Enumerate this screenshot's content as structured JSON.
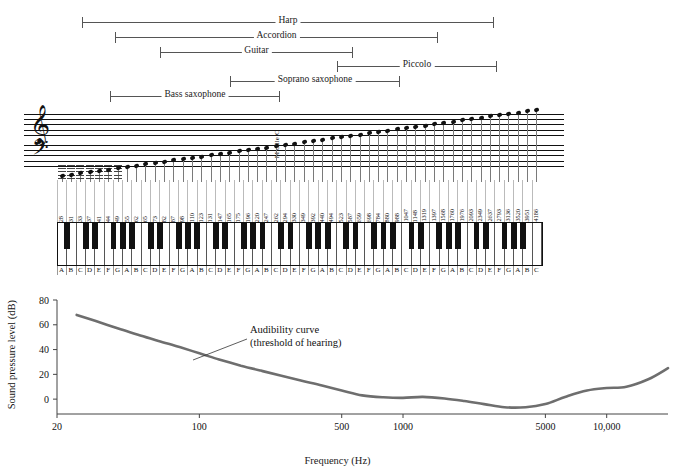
{
  "figure": {
    "instrument_ranges": [
      {
        "name": "Harp",
        "x1": 82,
        "x2": 494,
        "y": 16
      },
      {
        "name": "Accordion",
        "x1": 115,
        "x2": 438,
        "y": 31
      },
      {
        "name": "Guitar",
        "x1": 160,
        "x2": 353,
        "y": 46
      },
      {
        "name": "Piccolo",
        "x1": 337,
        "x2": 497,
        "y": 60
      },
      {
        "name": "Soprano saxophone",
        "x1": 230,
        "x2": 400,
        "y": 75
      },
      {
        "name": "Bass saxophone",
        "x1": 110,
        "x2": 280,
        "y": 90
      }
    ],
    "staff": {
      "treble_clef": "𝄞",
      "bass_clef": "𝄢",
      "middle_c_label": "Middle C"
    },
    "keyboard": {
      "note_letters": [
        "A",
        "B",
        "C",
        "D",
        "E",
        "F",
        "G",
        "A",
        "B",
        "C",
        "D",
        "E",
        "F",
        "G",
        "A",
        "B",
        "C",
        "D",
        "E",
        "F",
        "G",
        "A",
        "B",
        "C",
        "D",
        "E",
        "F",
        "G",
        "A",
        "B",
        "C",
        "D",
        "E",
        "F",
        "G",
        "A",
        "B",
        "C",
        "D",
        "E",
        "F",
        "G",
        "A",
        "B",
        "C",
        "D",
        "E",
        "F",
        "G",
        "A",
        "B",
        "C"
      ],
      "frequencies": [
        28,
        31,
        33,
        37,
        41,
        44,
        49,
        55,
        62,
        65,
        73,
        82,
        87,
        98,
        110,
        123,
        131,
        147,
        165,
        175,
        196,
        220,
        247,
        262,
        294,
        330,
        349,
        392,
        440,
        494,
        523,
        587,
        659,
        698,
        784,
        880,
        988,
        1047,
        1148,
        1319,
        1397,
        1568,
        1760,
        1976,
        2093,
        2349,
        2637,
        2793,
        3136,
        3520,
        3951,
        4186
      ],
      "black_key_after": [
        true,
        false,
        true,
        true,
        false,
        true,
        true,
        true,
        false,
        true,
        true,
        false,
        true,
        true,
        true,
        false,
        true,
        true,
        false,
        true,
        true,
        true,
        false,
        true,
        true,
        false,
        true,
        true,
        true,
        false,
        true,
        true,
        false,
        true,
        true,
        true,
        false,
        true,
        true,
        false,
        true,
        true,
        true,
        false,
        true,
        true,
        false,
        true,
        true,
        true,
        false,
        false
      ]
    },
    "chart_data": {
      "type": "line",
      "title": "",
      "xlabel": "Frequency (Hz)",
      "ylabel": "Sound pressure level (dB)",
      "xscale": "log",
      "xlim": [
        20,
        20000
      ],
      "ylim": [
        -12,
        80
      ],
      "xticks": [
        20,
        100,
        500,
        1000,
        5000,
        10000
      ],
      "xticklabels": [
        "20",
        "100",
        "500",
        "1000",
        "5000",
        "10,000"
      ],
      "yticks": [
        0,
        20,
        40,
        60,
        80
      ],
      "yticklabels": [
        "0",
        "20",
        "40",
        "60",
        "80"
      ],
      "grid": false,
      "legend": "none",
      "annotation": {
        "line1": "Audibility curve",
        "line2": "(threshold of hearing)"
      },
      "series": [
        {
          "name": "Audibility curve (threshold of hearing)",
          "color": "#6e6e6e",
          "x": [
            25,
            31,
            40,
            50,
            63,
            80,
            100,
            125,
            160,
            200,
            250,
            315,
            400,
            500,
            630,
            800,
            1000,
            1250,
            1600,
            2000,
            2500,
            3150,
            4000,
            5000,
            6300,
            8000,
            10000,
            12500,
            16000,
            20000
          ],
          "y": [
            68,
            63,
            57,
            52,
            47,
            42,
            37,
            32,
            27,
            23,
            19,
            15,
            11,
            7,
            3,
            1.5,
            1,
            1.8,
            0.5,
            -1.5,
            -4,
            -6.5,
            -6.5,
            -4,
            2,
            7,
            9,
            10,
            16,
            25
          ]
        }
      ]
    }
  }
}
